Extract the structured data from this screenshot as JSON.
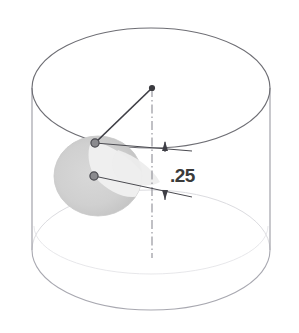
{
  "drawing": {
    "title": "cylinder-with-angled-feature",
    "type": "technical-isometric-sketch",
    "background_color": "#ffffff",
    "outline_color": "#6e6e74",
    "faint_outline_color": "#c9c9cf",
    "construction_color": "#3f3f46",
    "centerline_color": "#8d8d95",
    "shade_color": "#d2d2d2",
    "shade_color_light": "#e8e8e8",
    "node_color": "#555558"
  },
  "cylinder": {
    "name": "cylinder-body",
    "center_x": 151,
    "top_center_y": 88,
    "bottom_center_y": 250,
    "radius_x": 119,
    "radius_y": 60,
    "left_edge_x": 32,
    "right_edge_x": 270,
    "top_apex_y": 28,
    "bottom_apex_y": 310
  },
  "features": {
    "apex_point": {
      "name": "axis-top-point",
      "x": 152,
      "y": 88
    },
    "upper_node": {
      "name": "upper-edge-node",
      "x": 95,
      "y": 143
    },
    "lower_node": {
      "name": "lower-edge-node",
      "x": 94,
      "y": 176
    },
    "shaded_patch": {
      "name": "shaded-cut-face",
      "center_x": 98,
      "center_y": 176,
      "radius_x": 44,
      "radius_y": 40
    },
    "centerline": {
      "name": "vertical-axis-centerline",
      "x": 152,
      "y_top": 88,
      "y_bottom": 258
    }
  },
  "dimension": {
    "name": "height-dimension",
    "label": ".25",
    "label_x": 172,
    "label_y": 183,
    "arrow_x": 165,
    "upper_arrow_y": 150,
    "lower_arrow_y": 198,
    "extension_right_x": 192,
    "upper_ext_left_x": 95,
    "upper_ext_left_y": 143,
    "lower_ext_left_x": 94,
    "lower_ext_left_y": 176
  }
}
